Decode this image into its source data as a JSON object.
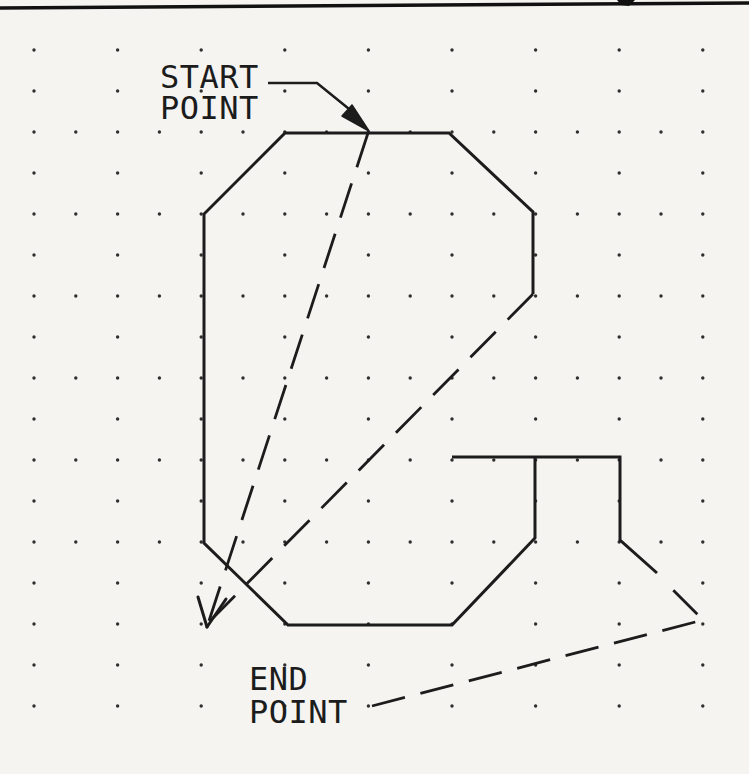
{
  "page": {
    "background_color": "#f5f4f1",
    "ink_color": "#1c1c1c",
    "top_rule": {
      "x1": 0,
      "y1": 8,
      "x2": 749,
      "y2": 3,
      "width": 3.5
    },
    "header_glyph_fragment": {
      "points": [
        [
          617,
          0
        ],
        [
          635,
          0
        ],
        [
          629,
          6
        ],
        [
          621,
          5
        ]
      ]
    }
  },
  "labels": {
    "start_point": {
      "line1": "START",
      "line2": "POINT"
    },
    "end_point": {
      "line1": "END",
      "line2": "POINT"
    }
  },
  "figure": {
    "grid": {
      "origin_x": 34,
      "origin_y": 50,
      "dx": 41.8,
      "dy": 41,
      "cols": 17,
      "rows": 17,
      "full_rows": [
        2,
        4,
        6,
        8,
        10,
        12
      ],
      "dot_radius": 1.7,
      "dot_color": "#2e2e2e"
    },
    "letter_g": {
      "stroke_width": 3,
      "paths": [
        [
          [
            533,
            294
          ],
          [
            533,
            212
          ],
          [
            449,
            133
          ],
          [
            285,
            133
          ],
          [
            204,
            214
          ],
          [
            204,
            543
          ],
          [
            288,
            625
          ],
          [
            452,
            625
          ],
          [
            535,
            538
          ],
          [
            535,
            457
          ]
        ],
        [
          [
            452,
            457
          ],
          [
            620,
            457
          ],
          [
            620,
            540
          ],
          [
            657,
            573
          ]
        ]
      ]
    },
    "rubber_band_lines": [
      {
        "points": [
          [
            368,
            133
          ],
          [
            207,
            627
          ]
        ],
        "dash": "36 17",
        "stroke_width": 2.8
      },
      {
        "points": [
          [
            533,
            294
          ],
          [
            209,
            622
          ]
        ],
        "dash": "36 17",
        "stroke_width": 2.8
      }
    ],
    "cursor_arrow": {
      "vertex": [
        207,
        627
      ],
      "barbs": [
        [
          198,
          597
        ],
        [
          226,
          599
        ]
      ],
      "stroke_width": 3
    },
    "start_leader": {
      "solid_points": [
        [
          268,
          83
        ],
        [
          317,
          83
        ],
        [
          354,
          113
        ]
      ],
      "arrow": [
        [
          369,
          131
        ],
        [
          352,
          105
        ],
        [
          342,
          116
        ]
      ],
      "stroke_width": 2.5
    },
    "end_leader": {
      "points": [
        [
          372,
          706
        ],
        [
          703,
          620
        ],
        [
          668,
          585
        ]
      ],
      "dash": "34 16",
      "stroke_width": 2.8
    }
  }
}
